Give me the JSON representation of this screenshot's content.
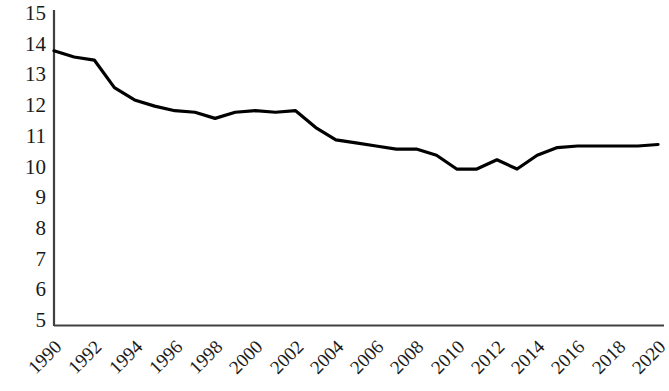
{
  "chart_data": {
    "type": "line",
    "title": "",
    "subtitle": "",
    "xlabel": "",
    "ylabel": "",
    "xlim": [
      1990,
      2020
    ],
    "ylim": [
      5,
      15
    ],
    "grid": false,
    "legend": null,
    "y_ticks": [
      15,
      14,
      13,
      12,
      11,
      10,
      9,
      8,
      7,
      6,
      5
    ],
    "x_ticks": [
      1990,
      1992,
      1994,
      1996,
      1998,
      2000,
      2002,
      2004,
      2006,
      2008,
      2010,
      2012,
      2014,
      2016,
      2018,
      2020
    ],
    "x_tick_rotation_deg": -45,
    "series": [
      {
        "name": "series-1",
        "color": "#000000",
        "line_width": 3,
        "x": [
          1990,
          1991,
          1992,
          1993,
          1994,
          1995,
          1996,
          1997,
          1998,
          1999,
          2000,
          2001,
          2002,
          2003,
          2004,
          2005,
          2006,
          2007,
          2008,
          2009,
          2010,
          2011,
          2012,
          2013,
          2014,
          2015,
          2016,
          2017,
          2018,
          2019,
          2020
        ],
        "values": [
          13.8,
          13.6,
          13.5,
          12.6,
          12.2,
          12.0,
          11.85,
          11.8,
          11.6,
          11.8,
          11.85,
          11.8,
          11.85,
          11.3,
          10.9,
          10.8,
          10.7,
          10.6,
          10.6,
          10.4,
          9.95,
          9.95,
          10.25,
          9.95,
          10.4,
          10.65,
          10.7,
          10.7,
          10.7,
          10.7,
          10.75
        ]
      }
    ]
  },
  "axes": {
    "left_axis_color": "#404040",
    "bottom_axis_color": "#404040",
    "tick_label_color": "#1a1a1a"
  }
}
